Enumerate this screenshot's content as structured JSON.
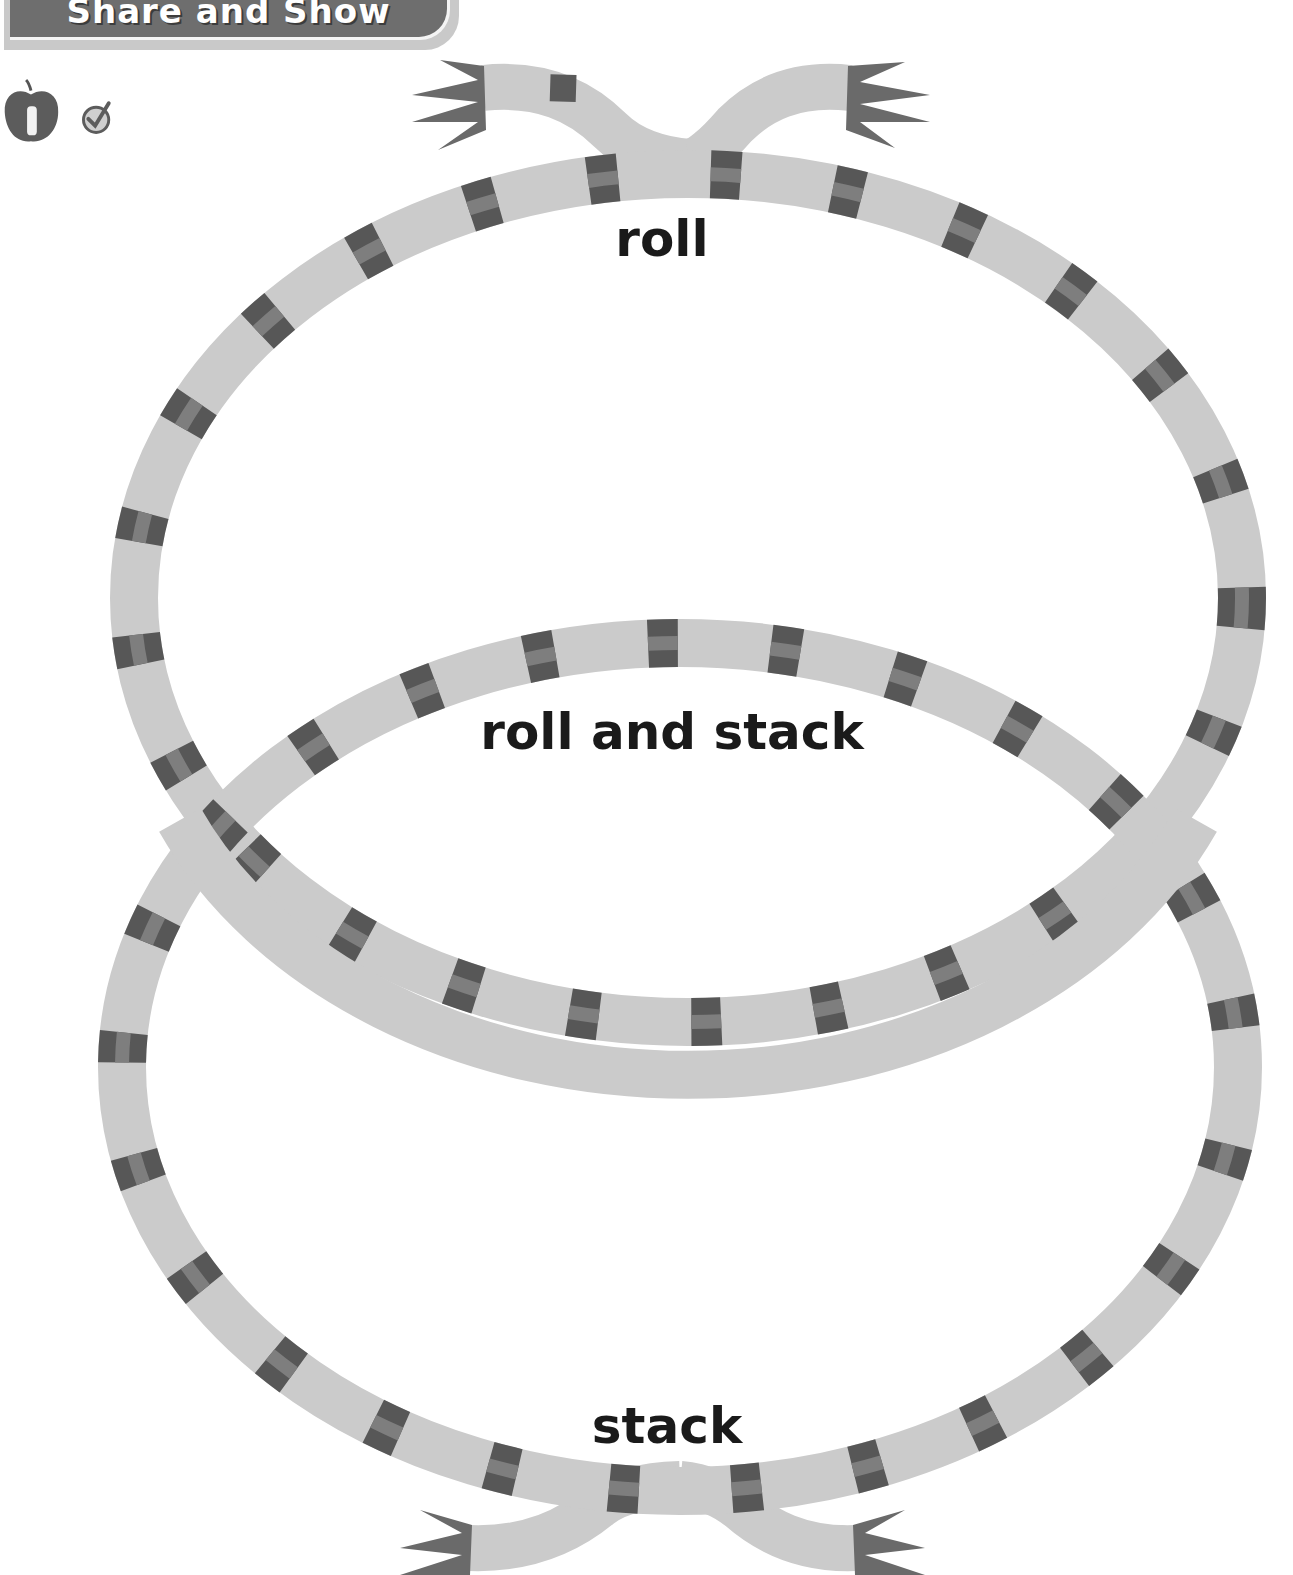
{
  "header": {
    "title": "Share and Show"
  },
  "icons": {
    "apple_number": "1",
    "apple": "apple-icon",
    "check": "check-circle-icon"
  },
  "diagram": {
    "type": "venn",
    "regions": [
      {
        "id": "top",
        "label": "roll"
      },
      {
        "id": "overlap",
        "label": "roll and stack"
      },
      {
        "id": "bottom",
        "label": "stack"
      }
    ]
  },
  "colors": {
    "header_bg": "#6e6e6e",
    "band": "#cbcbcb",
    "stripe_dark": "#555555",
    "stripe_mid": "#7a7a7a",
    "text": "#1a1a1a"
  }
}
